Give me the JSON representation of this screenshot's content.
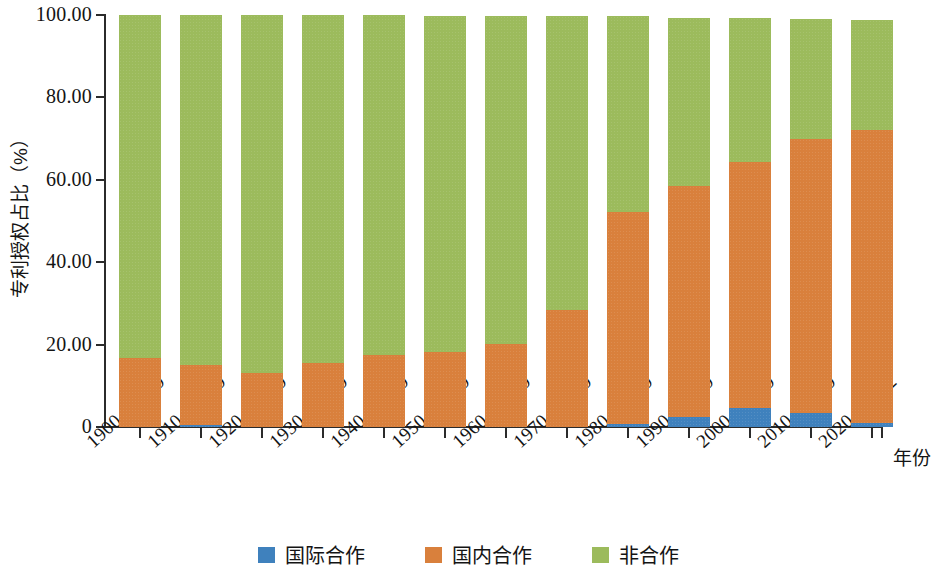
{
  "chart_data": {
    "type": "bar",
    "stacked": true,
    "title": "",
    "xlabel": "年份",
    "ylabel": "专利授权占比（%）",
    "ylim": [
      0,
      100
    ],
    "yticks": [
      0,
      20,
      40,
      60,
      80,
      100
    ],
    "ytick_labels": [
      "0",
      "20.00",
      "40.00",
      "60.00",
      "80.00",
      "100.00"
    ],
    "grid": false,
    "legend_position": "bottom",
    "categories": [
      "1900—1909",
      "1910—1919",
      "1920—1929",
      "1930—1939",
      "1940—1949",
      "1950—1959",
      "1960—1969",
      "1970—1979",
      "1980—1989",
      "1990—1999",
      "2000—2009",
      "2010—2019",
      "2020—2022"
    ],
    "series": [
      {
        "name": "国际合作",
        "color": "#3f81bd",
        "values": [
          0.0,
          0.4,
          0.0,
          0.0,
          0.0,
          0.0,
          0.0,
          0.0,
          0.8,
          2.4,
          4.6,
          3.4,
          1.0
        ]
      },
      {
        "name": "国内合作",
        "color": "#d9803c",
        "values": [
          16.7,
          14.6,
          13.0,
          15.6,
          17.5,
          18.2,
          20.1,
          28.4,
          51.3,
          56.1,
          59.7,
          66.6,
          71.0
        ]
      },
      {
        "name": "非合作",
        "color": "#9cbb5c",
        "values": [
          83.3,
          85.0,
          87.0,
          84.4,
          82.5,
          81.6,
          79.7,
          71.3,
          47.6,
          40.8,
          35.0,
          29.1,
          26.9
        ]
      }
    ],
    "stack_totals": [
      100.0,
      100.0,
      100.0,
      100.0,
      100.0,
      99.8,
      99.8,
      99.7,
      99.7,
      99.3,
      99.3,
      99.1,
      98.9
    ]
  },
  "legend": {
    "items": [
      {
        "label": "国际合作",
        "color": "#3f81bd"
      },
      {
        "label": "国内合作",
        "color": "#d9803c"
      },
      {
        "label": "非合作",
        "color": "#9cbb5c"
      }
    ]
  }
}
